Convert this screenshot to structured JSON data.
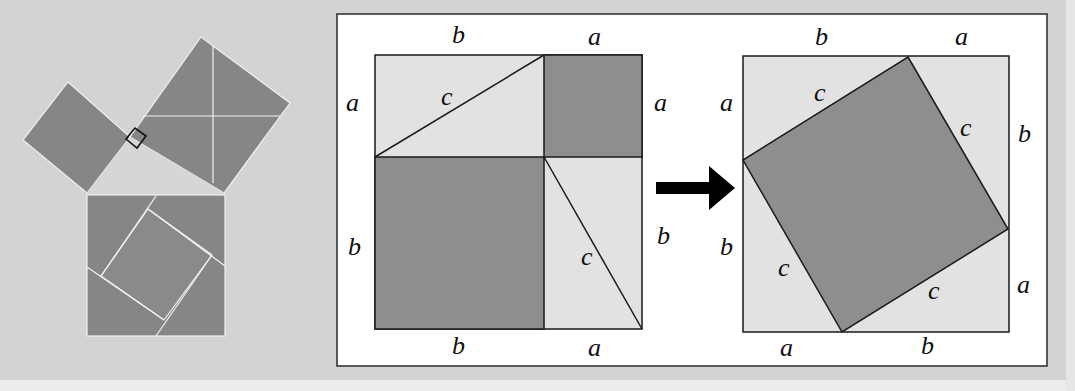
{
  "figure": {
    "colors": {
      "background": "#d3d3d3",
      "panel": "#ffffff",
      "dark_fill": "#8e8e8e",
      "light_fill": "#e2e2e2",
      "stroke": "#1a1a1a",
      "left_square_fill": "#868686",
      "arrow": "#000000"
    },
    "left_diagram": {
      "description": "Right triangle with squares on each side; hypotenuse square dissected",
      "right_angle_marker": "square"
    },
    "panel_left": {
      "labels": {
        "top_b": "b",
        "top_a": "a",
        "left_a": "a",
        "left_b": "b",
        "right_a": "a",
        "right_b": "b",
        "bottom_b": "b",
        "bottom_a": "a",
        "diag_top_c": "c",
        "diag_bottom_c": "c"
      }
    },
    "arrow": {
      "icon": "right-arrow-icon"
    },
    "panel_right": {
      "labels": {
        "top_b": "b",
        "top_a": "a",
        "left_a": "a",
        "left_b": "b",
        "right_b": "b",
        "right_a": "a",
        "bottom_a": "a",
        "bottom_b": "b",
        "c_top_left": "c",
        "c_top_right": "c",
        "c_bottom_left": "c",
        "c_bottom_right": "c"
      }
    }
  }
}
